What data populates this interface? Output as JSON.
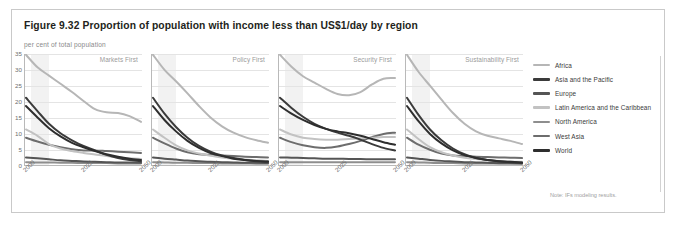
{
  "figure": {
    "title": "Figure 9.32 Proportion of population with income less than US$1/day by region",
    "subtitle": "per cent of total population",
    "note": "Note: IFs modeling results."
  },
  "legend": {
    "items": [
      {
        "label": "Africa",
        "color": "#b6b6b6"
      },
      {
        "label": "Asia and the Pacific",
        "color": "#3b3b3b"
      },
      {
        "label": "Europe",
        "color": "#555555"
      },
      {
        "label": "Latin America and the Caribbean",
        "color": "#c2c2c2"
      },
      {
        "label": "North America",
        "color": "#8e8e8e"
      },
      {
        "label": "West Asia",
        "color": "#6d6d6d"
      },
      {
        "label": "World",
        "color": "#2e2e2e"
      }
    ]
  },
  "chart_data": {
    "type": "line",
    "title": "Figure 9.32 Proportion of population with income less than US$1/day by region",
    "ylabel": "per cent of total population",
    "xlabel": "",
    "ylim": [
      0,
      35
    ],
    "yticks": [
      0,
      5,
      10,
      15,
      20,
      25,
      30,
      35
    ],
    "xlim": [
      2000,
      2050
    ],
    "xticks": [
      2000,
      2025,
      2050
    ],
    "grid": true,
    "legend_position": "right",
    "shaded_band": {
      "from": 2002,
      "to": 2010,
      "color": "#f2f2f2"
    },
    "x": [
      2000,
      2005,
      2010,
      2015,
      2020,
      2025,
      2030,
      2035,
      2040,
      2045,
      2050
    ],
    "panels": [
      {
        "title": "Markets First",
        "series": [
          {
            "name": "Africa",
            "values": [
              35.0,
              30.8,
              28.2,
              25.6,
              23.0,
              20.2,
              17.6,
              16.6,
              16.4,
              15.4,
              13.6
            ]
          },
          {
            "name": "Asia and the Pacific",
            "values": [
              21.2,
              17.0,
              13.0,
              10.0,
              7.8,
              6.0,
              4.6,
              3.2,
              2.2,
              1.6,
              1.2
            ]
          },
          {
            "name": "Europe",
            "values": [
              2.4,
              2.1,
              1.8,
              1.5,
              1.3,
              1.1,
              1.0,
              0.9,
              0.8,
              0.8,
              0.7
            ]
          },
          {
            "name": "Latin America and the Caribbean",
            "values": [
              11.2,
              9.2,
              6.6,
              5.2,
              4.4,
              3.8,
              3.3,
              2.8,
              2.4,
              2.1,
              1.9
            ]
          },
          {
            "name": "North America",
            "values": [
              0.9,
              0.8,
              0.8,
              0.7,
              0.7,
              0.6,
              0.6,
              0.6,
              0.5,
              0.5,
              0.5
            ]
          },
          {
            "name": "West Asia",
            "values": [
              8.6,
              7.4,
              6.4,
              5.6,
              5.0,
              4.6,
              4.6,
              4.4,
              4.2,
              4.0,
              3.8
            ]
          },
          {
            "name": "World",
            "values": [
              18.6,
              15.0,
              11.6,
              9.0,
              7.0,
              5.6,
              4.4,
              3.4,
              2.6,
              2.0,
              1.6
            ]
          }
        ]
      },
      {
        "title": "Policy First",
        "series": [
          {
            "name": "Africa",
            "values": [
              35.0,
              30.0,
              26.4,
              22.6,
              18.6,
              15.0,
              12.2,
              10.2,
              8.8,
              7.8,
              7.0
            ]
          },
          {
            "name": "Asia and the Pacific",
            "values": [
              21.2,
              16.2,
              12.0,
              8.6,
              6.0,
              4.2,
              3.0,
              2.2,
              1.6,
              1.2,
              1.0
            ]
          },
          {
            "name": "Europe",
            "values": [
              2.4,
              2.0,
              1.7,
              1.4,
              1.2,
              1.0,
              0.9,
              0.8,
              0.7,
              0.7,
              0.6
            ]
          },
          {
            "name": "Latin America and the Caribbean",
            "values": [
              11.2,
              8.6,
              6.2,
              4.6,
              3.6,
              2.9,
              2.4,
              2.0,
              1.7,
              1.5,
              1.3
            ]
          },
          {
            "name": "North America",
            "values": [
              0.9,
              0.8,
              0.7,
              0.7,
              0.6,
              0.6,
              0.5,
              0.5,
              0.5,
              0.4,
              0.4
            ]
          },
          {
            "name": "West Asia",
            "values": [
              8.6,
              6.8,
              5.2,
              4.0,
              3.4,
              3.2,
              3.0,
              2.8,
              2.6,
              2.5,
              2.4
            ]
          },
          {
            "name": "World",
            "values": [
              18.6,
              14.2,
              10.6,
              7.6,
              5.4,
              3.8,
              2.8,
              2.0,
              1.6,
              1.3,
              1.1
            ]
          }
        ]
      },
      {
        "title": "Security First",
        "series": [
          {
            "name": "Africa",
            "values": [
              35.0,
              31.0,
              28.0,
              26.0,
              24.0,
              22.4,
              22.0,
              23.0,
              25.4,
              27.2,
              27.4
            ]
          },
          {
            "name": "Asia and the Pacific",
            "values": [
              21.2,
              18.0,
              15.2,
              13.0,
              11.4,
              10.2,
              9.2,
              8.0,
              6.6,
              5.4,
              4.6
            ]
          },
          {
            "name": "Europe",
            "values": [
              2.4,
              2.3,
              2.2,
              2.1,
              2.0,
              2.0,
              1.9,
              1.9,
              1.8,
              1.8,
              1.8
            ]
          },
          {
            "name": "Latin America and the Caribbean",
            "values": [
              11.2,
              9.6,
              8.6,
              8.2,
              8.0,
              8.0,
              8.2,
              8.4,
              8.6,
              8.8,
              8.8
            ]
          },
          {
            "name": "North America",
            "values": [
              0.9,
              0.9,
              0.9,
              0.9,
              0.9,
              0.9,
              0.9,
              0.9,
              0.9,
              0.9,
              0.9
            ]
          },
          {
            "name": "West Asia",
            "values": [
              8.6,
              7.2,
              6.2,
              5.6,
              5.4,
              5.8,
              6.6,
              7.6,
              8.8,
              9.8,
              10.2
            ]
          },
          {
            "name": "World",
            "values": [
              18.6,
              16.2,
              14.2,
              12.6,
              11.4,
              10.6,
              10.0,
              9.2,
              8.2,
              7.2,
              6.4
            ]
          }
        ]
      },
      {
        "title": "Sustainability First",
        "series": [
          {
            "name": "Africa",
            "values": [
              35.0,
              29.4,
              25.0,
              20.6,
              16.4,
              13.0,
              10.6,
              9.2,
              8.4,
              7.6,
              6.6
            ]
          },
          {
            "name": "Asia and the Pacific",
            "values": [
              21.2,
              15.8,
              11.2,
              7.8,
              5.2,
              3.4,
              2.2,
              1.6,
              1.2,
              0.9,
              0.7
            ]
          },
          {
            "name": "Europe",
            "values": [
              2.4,
              2.0,
              1.6,
              1.3,
              1.1,
              0.9,
              0.8,
              0.7,
              0.6,
              0.6,
              0.5
            ]
          },
          {
            "name": "Latin America and the Caribbean",
            "values": [
              11.2,
              8.2,
              5.6,
              4.0,
              3.0,
              2.3,
              1.9,
              1.6,
              1.3,
              1.1,
              1.0
            ]
          },
          {
            "name": "North America",
            "values": [
              0.9,
              0.8,
              0.7,
              0.6,
              0.6,
              0.5,
              0.5,
              0.5,
              0.4,
              0.4,
              0.4
            ]
          },
          {
            "name": "West Asia",
            "values": [
              8.6,
              6.4,
              4.8,
              3.6,
              3.0,
              2.8,
              2.6,
              2.5,
              2.4,
              2.3,
              2.2
            ]
          },
          {
            "name": "World",
            "values": [
              18.6,
              13.8,
              9.8,
              6.8,
              4.6,
              3.1,
              2.2,
              1.6,
              1.2,
              1.0,
              0.8
            ]
          }
        ]
      }
    ]
  }
}
